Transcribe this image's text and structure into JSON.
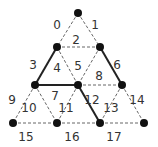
{
  "diagram": {
    "type": "triangular-lattice",
    "colors": {
      "node": "#111111",
      "solid_edge": "#222222",
      "dashed_edge": "#666666",
      "label": "#333333"
    },
    "nodes": [
      {
        "id": "n0",
        "x": 78,
        "y": 13
      },
      {
        "id": "n1",
        "x": 57,
        "y": 47
      },
      {
        "id": "n2",
        "x": 100,
        "y": 47
      },
      {
        "id": "n3",
        "x": 35,
        "y": 85
      },
      {
        "id": "n4",
        "x": 78,
        "y": 85
      },
      {
        "id": "n5",
        "x": 122,
        "y": 85
      },
      {
        "id": "n6",
        "x": 13,
        "y": 123
      },
      {
        "id": "n7",
        "x": 57,
        "y": 123
      },
      {
        "id": "n8",
        "x": 100,
        "y": 123
      },
      {
        "id": "n9",
        "x": 144,
        "y": 123
      }
    ],
    "edges": [
      {
        "from": "n0",
        "to": "n1",
        "style": "dashed"
      },
      {
        "from": "n0",
        "to": "n2",
        "style": "dashed"
      },
      {
        "from": "n1",
        "to": "n2",
        "style": "dashed"
      },
      {
        "from": "n1",
        "to": "n3",
        "style": "solid"
      },
      {
        "from": "n1",
        "to": "n4",
        "style": "dashed"
      },
      {
        "from": "n2",
        "to": "n4",
        "style": "dashed"
      },
      {
        "from": "n2",
        "to": "n5",
        "style": "solid"
      },
      {
        "from": "n3",
        "to": "n4",
        "style": "solid"
      },
      {
        "from": "n4",
        "to": "n5",
        "style": "dashed"
      },
      {
        "from": "n3",
        "to": "n6",
        "style": "dashed"
      },
      {
        "from": "n3",
        "to": "n7",
        "style": "dashed"
      },
      {
        "from": "n4",
        "to": "n7",
        "style": "dashed"
      },
      {
        "from": "n4",
        "to": "n8",
        "style": "solid"
      },
      {
        "from": "n5",
        "to": "n8",
        "style": "dashed"
      },
      {
        "from": "n5",
        "to": "n9",
        "style": "dashed"
      },
      {
        "from": "n6",
        "to": "n7",
        "style": "dashed"
      },
      {
        "from": "n7",
        "to": "n8",
        "style": "dashed"
      },
      {
        "from": "n8",
        "to": "n9",
        "style": "dashed"
      }
    ],
    "labels": [
      {
        "text": "0",
        "x": 57,
        "y": 29
      },
      {
        "text": "1",
        "x": 95,
        "y": 29
      },
      {
        "text": "2",
        "x": 76,
        "y": 44
      },
      {
        "text": "3",
        "x": 33,
        "y": 69
      },
      {
        "text": "4",
        "x": 57,
        "y": 72
      },
      {
        "text": "5",
        "x": 78,
        "y": 70
      },
      {
        "text": "6",
        "x": 117,
        "y": 69
      },
      {
        "text": "7",
        "x": 55,
        "y": 100
      },
      {
        "text": "8",
        "x": 99,
        "y": 80
      },
      {
        "text": "9",
        "x": 12,
        "y": 104
      },
      {
        "text": "10",
        "x": 29,
        "y": 112
      },
      {
        "text": "11",
        "x": 66,
        "y": 112
      },
      {
        "text": "12",
        "x": 92,
        "y": 104
      },
      {
        "text": "13",
        "x": 111,
        "y": 112
      },
      {
        "text": "14",
        "x": 137,
        "y": 104
      },
      {
        "text": "15",
        "x": 26,
        "y": 141
      },
      {
        "text": "16",
        "x": 72,
        "y": 141
      },
      {
        "text": "17",
        "x": 114,
        "y": 141
      }
    ]
  }
}
